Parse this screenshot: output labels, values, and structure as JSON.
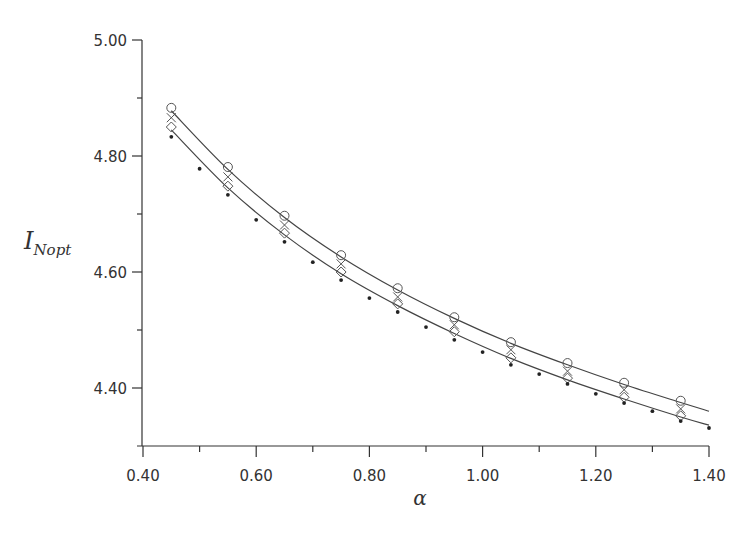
{
  "chart_data": {
    "type": "scatter",
    "title": "",
    "xlabel": "α",
    "ylabel": "I",
    "ylabel_subscript": "Nopt",
    "xlim": [
      0.4,
      1.4
    ],
    "ylim": [
      4.3,
      5.0
    ],
    "x_ticks": [
      0.4,
      0.6,
      0.8,
      1.0,
      1.2,
      1.4
    ],
    "x_tick_labels": [
      "0.40",
      "0.60",
      "0.80",
      "1.00",
      "1.20",
      "1.40"
    ],
    "x_minor_ticks": [
      0.5,
      0.7,
      0.9,
      1.1,
      1.3
    ],
    "y_ticks": [
      4.4,
      4.6,
      4.8,
      5.0
    ],
    "y_tick_labels": [
      "4.40",
      "4.60",
      "4.80",
      "5.00"
    ],
    "y_minor_ticks": [
      4.5,
      4.7,
      4.9
    ],
    "grid": false,
    "legend": null,
    "series": [
      {
        "name": "circles",
        "marker": "circle",
        "x": [
          0.45,
          0.55,
          0.65,
          0.75,
          0.85,
          0.95,
          1.05,
          1.15,
          1.25,
          1.35
        ],
        "values": [
          4.883,
          4.781,
          4.697,
          4.629,
          4.572,
          4.522,
          4.479,
          4.443,
          4.409,
          4.378
        ]
      },
      {
        "name": "crosses",
        "marker": "x",
        "x": [
          0.45,
          0.55,
          0.65,
          0.75,
          0.85,
          0.95,
          1.05,
          1.15,
          1.25,
          1.35
        ],
        "values": [
          4.866,
          4.764,
          4.681,
          4.614,
          4.557,
          4.509,
          4.466,
          4.429,
          4.397,
          4.364
        ]
      },
      {
        "name": "diamonds",
        "marker": "diamond",
        "x": [
          0.45,
          0.55,
          0.65,
          0.75,
          0.85,
          0.95,
          1.05,
          1.15,
          1.25,
          1.35
        ],
        "values": [
          4.85,
          4.748,
          4.667,
          4.6,
          4.545,
          4.497,
          4.452,
          4.417,
          4.384,
          4.352
        ]
      },
      {
        "name": "dots",
        "marker": "dot",
        "x": [
          0.45,
          0.5,
          0.55,
          0.6,
          0.65,
          0.7,
          0.75,
          0.8,
          0.85,
          0.9,
          0.95,
          1.0,
          1.05,
          1.1,
          1.15,
          1.2,
          1.25,
          1.3,
          1.35,
          1.4
        ],
        "values": [
          4.833,
          4.778,
          4.733,
          4.69,
          4.652,
          4.617,
          4.586,
          4.555,
          4.531,
          4.505,
          4.483,
          4.462,
          4.44,
          4.424,
          4.407,
          4.39,
          4.374,
          4.36,
          4.343,
          4.331
        ]
      },
      {
        "name": "upper-fit-curve",
        "marker": "line",
        "x": [
          0.45,
          0.55,
          0.65,
          0.75,
          0.85,
          0.95,
          1.05,
          1.15,
          1.25,
          1.35,
          1.4
        ],
        "values": [
          4.878,
          4.777,
          4.694,
          4.626,
          4.569,
          4.52,
          4.477,
          4.44,
          4.406,
          4.375,
          4.36
        ]
      },
      {
        "name": "lower-fit-curve",
        "marker": "line",
        "x": [
          0.45,
          0.55,
          0.65,
          0.75,
          0.85,
          0.95,
          1.05,
          1.15,
          1.25,
          1.35,
          1.4
        ],
        "values": [
          4.845,
          4.745,
          4.664,
          4.597,
          4.542,
          4.494,
          4.451,
          4.414,
          4.381,
          4.35,
          4.336
        ]
      }
    ]
  },
  "labels": {
    "xlabel": "α",
    "ylabel_main": "I",
    "ylabel_sub": "Nopt"
  }
}
